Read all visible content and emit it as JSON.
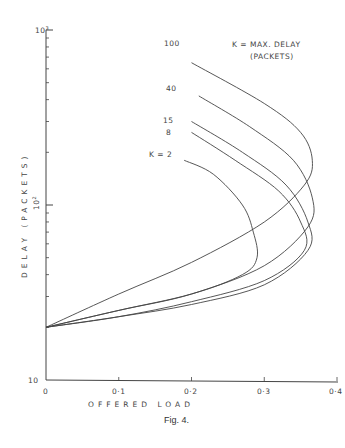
{
  "chart_data": {
    "type": "line",
    "title": "",
    "caption": "Fig. 4.",
    "xlabel": "OFFERED LOAD",
    "ylabel": "DELAY (PACKETS)",
    "xlim": [
      0,
      0.4
    ],
    "ylim": [
      10,
      1000
    ],
    "yscale": "log",
    "grid": false,
    "xticks": [
      "0",
      "0·1",
      "0·2",
      "0·3",
      "0·4"
    ],
    "yticks": [
      "10",
      "10²",
      "10³"
    ],
    "legend_note": [
      "K = MAX. DELAY",
      "(PACKETS)"
    ],
    "series": [
      {
        "name": "K = 2",
        "label": "K = 2",
        "points": [
          [
            0,
            20
          ],
          [
            0.1,
            25
          ],
          [
            0.2,
            31
          ],
          [
            0.27,
            40
          ],
          [
            0.29,
            50
          ],
          [
            0.285,
            70
          ],
          [
            0.27,
            100
          ],
          [
            0.23,
            150
          ],
          [
            0.19,
            180
          ]
        ]
      },
      {
        "name": "8",
        "label": "8",
        "points": [
          [
            0,
            20
          ],
          [
            0.1,
            23
          ],
          [
            0.2,
            28
          ],
          [
            0.3,
            37
          ],
          [
            0.355,
            55
          ],
          [
            0.35,
            80
          ],
          [
            0.32,
            120
          ],
          [
            0.26,
            180
          ],
          [
            0.2,
            260
          ]
        ]
      },
      {
        "name": "15",
        "label": "15",
        "points": [
          [
            0,
            20
          ],
          [
            0.1,
            23
          ],
          [
            0.2,
            27
          ],
          [
            0.3,
            35
          ],
          [
            0.36,
            55
          ],
          [
            0.36,
            80
          ],
          [
            0.33,
            130
          ],
          [
            0.27,
            200
          ],
          [
            0.2,
            300
          ]
        ]
      },
      {
        "name": "40",
        "label": "40",
        "points": [
          [
            0,
            20
          ],
          [
            0.1,
            25
          ],
          [
            0.2,
            31
          ],
          [
            0.3,
            45
          ],
          [
            0.36,
            75
          ],
          [
            0.366,
            110
          ],
          [
            0.34,
            180
          ],
          [
            0.28,
            280
          ],
          [
            0.21,
            420
          ]
        ]
      },
      {
        "name": "100",
        "label": "100",
        "points": [
          [
            0,
            20
          ],
          [
            0.1,
            31
          ],
          [
            0.2,
            47
          ],
          [
            0.3,
            80
          ],
          [
            0.355,
            130
          ],
          [
            0.366,
            180
          ],
          [
            0.35,
            260
          ],
          [
            0.3,
            380
          ],
          [
            0.2,
            650
          ]
        ]
      }
    ]
  },
  "page": {
    "caption": "Fig. 4.",
    "xlabel": "OFFERED LOAD",
    "ylabel": "DELAY (PACKETS)",
    "legend_line1": "K = MAX. DELAY",
    "legend_line2": "(PACKETS)",
    "xtick_0": "0",
    "xtick_1": "0·1",
    "xtick_2": "0·2",
    "xtick_3": "0·3",
    "xtick_4": "0·4",
    "ytick_10": "10",
    "ytick_100_base": "10",
    "ytick_100_exp": "2",
    "ytick_1000_base": "10",
    "ytick_1000_exp": "3",
    "curve_labels": {
      "k2": "K = 2",
      "k8": "8",
      "k15": "15",
      "k40": "40",
      "k100": "100"
    }
  }
}
